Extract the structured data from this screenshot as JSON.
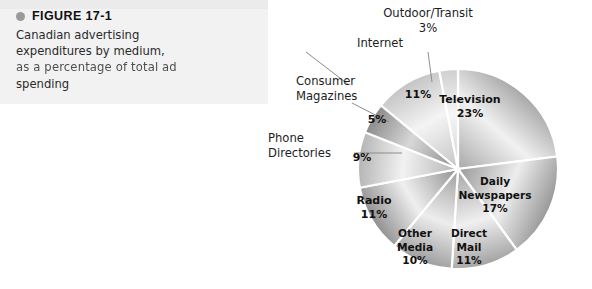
{
  "figure": {
    "bullet_icon": "bullet-dot-icon",
    "title": "FIGURE 17-1",
    "caption_lines": [
      "Canadian advertising",
      "expenditures by medium,",
      "as a percentage of total ad",
      "spending"
    ],
    "caption_full": "Canadian advertising expenditures by medium, as a percentage of total ad spending"
  },
  "chart_data": {
    "type": "pie",
    "title": "Canadian advertising expenditures by medium, as a percentage of total ad spending",
    "unit": "%",
    "total": 100,
    "legend": "inside-and-callout labels",
    "start_angle_deg": 0,
    "direction": "clockwise",
    "categories": [
      "Television",
      "Daily Newspapers",
      "Direct Mail",
      "Other Media",
      "Radio",
      "Phone Directories",
      "Consumer Magazines",
      "Internet",
      "Outdoor/Transit"
    ],
    "values": [
      23,
      17,
      11,
      10,
      11,
      9,
      5,
      11,
      3
    ],
    "slices": [
      {
        "name": "Television",
        "value": 23,
        "value_label": "23%",
        "label_lines": [
          "Television",
          "23%"
        ],
        "label_placement": "inside",
        "label_x": 218,
        "label_y": 103,
        "fill_light": "#f1f1f1",
        "fill_dark": "#a8a8a8"
      },
      {
        "name": "Daily Newspapers",
        "value": 17,
        "value_label": "17%",
        "label_lines": [
          "Daily",
          "Newspapers",
          "17%"
        ],
        "label_placement": "inside",
        "label_x": 243,
        "label_y": 185,
        "fill_light": "#ededed",
        "fill_dark": "#989898"
      },
      {
        "name": "Direct Mail",
        "value": 11,
        "value_label": "11%",
        "label_lines": [
          "Direct",
          "Mail",
          "11%"
        ],
        "label_placement": "inside",
        "label_x": 217,
        "label_y": 237,
        "fill_light": "#f0f0f0",
        "fill_dark": "#a3a3a3"
      },
      {
        "name": "Other Media",
        "value": 10,
        "value_label": "10%",
        "label_lines": [
          "Other",
          "Media",
          "10%"
        ],
        "label_placement": "inside",
        "label_x": 163,
        "label_y": 237,
        "fill_light": "#ededed",
        "fill_dark": "#9d9d9d"
      },
      {
        "name": "Radio",
        "value": 11,
        "value_label": "11%",
        "label_lines": [
          "Radio",
          "11%"
        ],
        "label_placement": "inside",
        "label_x": 122,
        "label_y": 204,
        "fill_light": "#efefef",
        "fill_dark": "#8f8f8f"
      },
      {
        "name": "Phone Directories",
        "value": 9,
        "value_label": "9%",
        "label_lines": [
          "9%"
        ],
        "label_placement": "callout",
        "label_x": 110,
        "label_y": 161,
        "fill_light": "#f2f2f2",
        "fill_dark": "#b4b4b4",
        "callout_lines": [
          "Phone",
          "Directories"
        ],
        "callout_x": 16,
        "callout_y": 142,
        "callout_anchor": "start"
      },
      {
        "name": "Consumer Magazines",
        "value": 5,
        "value_label": "5%",
        "label_lines": [
          "5%"
        ],
        "label_placement": "callout",
        "label_x": 125,
        "label_y": 123,
        "fill_light": "#d7d7d7",
        "fill_dark": "#8a8a8a",
        "callout_lines": [
          "Consumer",
          "Magazines"
        ],
        "callout_x": 44,
        "callout_y": 85,
        "callout_anchor": "start"
      },
      {
        "name": "Internet",
        "value": 11,
        "value_label": "11%",
        "label_lines": [
          "11%"
        ],
        "label_placement": "callout",
        "label_x": 166,
        "label_y": 98,
        "fill_light": "#f4f4f4",
        "fill_dark": "#c4c4c4",
        "callout_lines": [
          "Internet"
        ],
        "callout_x": 105,
        "callout_y": 47,
        "callout_anchor": "start"
      },
      {
        "name": "Outdoor/Transit",
        "value": 3,
        "value_label": "3%",
        "label_lines": [],
        "label_placement": "callout",
        "label_x": 196,
        "label_y": 40,
        "fill_light": "#f6f6f6",
        "fill_dark": "#cfcfcf",
        "callout_lines": [
          "Outdoor/Transit",
          "3%"
        ],
        "callout_x": 176,
        "callout_y": 17,
        "callout_anchor": "middle"
      }
    ],
    "geometry": {
      "cx": 206,
      "cy": 169,
      "r": 100
    },
    "separator_color": "#ffffff",
    "leader_color": "#8d8d8d"
  }
}
